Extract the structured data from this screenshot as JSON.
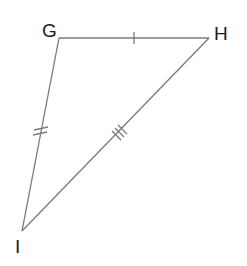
{
  "diagram": {
    "type": "triangle",
    "stroke_color": "#7a7a7a",
    "label_color": "#1a1a1a",
    "vertices": {
      "G": {
        "label": "G",
        "x": 59,
        "y": 38
      },
      "H": {
        "label": "H",
        "x": 209,
        "y": 38
      },
      "I": {
        "label": "I",
        "x": 22,
        "y": 231
      }
    },
    "sides": [
      {
        "name": "GH",
        "from": "G",
        "to": "H",
        "tick_marks": 1
      },
      {
        "name": "GI",
        "from": "G",
        "to": "I",
        "tick_marks": 2
      },
      {
        "name": "HI",
        "from": "H",
        "to": "I",
        "tick_marks": 3
      }
    ]
  }
}
